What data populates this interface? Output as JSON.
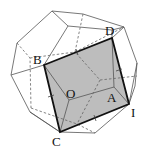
{
  "diagram": {
    "type": "polyhedron-cross-section",
    "shade_color": "#bdbdbd",
    "labels": {
      "B": "B",
      "D": "D",
      "O": "O",
      "A": "A",
      "I": "I",
      "C": "C"
    }
  }
}
